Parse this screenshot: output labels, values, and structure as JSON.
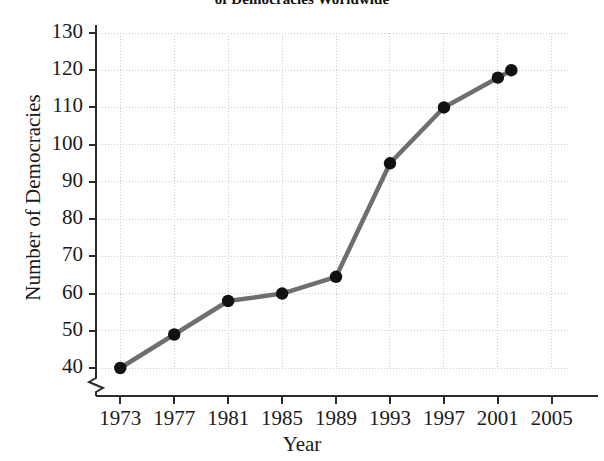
{
  "chart_data": {
    "type": "line",
    "title": "of Democracies Worldwide",
    "xlabel": "Year",
    "ylabel": "Number of Democracies",
    "x": [
      1973,
      1977,
      1981,
      1985,
      1989,
      1993,
      1997,
      2001,
      2002
    ],
    "values": [
      40,
      49,
      58,
      60,
      64.5,
      95,
      110,
      118,
      120
    ],
    "series": [
      {
        "name": "Number of Democracies",
        "points": [
          {
            "x": 1973,
            "y": 40
          },
          {
            "x": 1977,
            "y": 49
          },
          {
            "x": 1981,
            "y": 58
          },
          {
            "x": 1985,
            "y": 60
          },
          {
            "x": 1989,
            "y": 64.5
          },
          {
            "x": 1993,
            "y": 95
          },
          {
            "x": 1997,
            "y": 110
          },
          {
            "x": 2001,
            "y": 118
          },
          {
            "x": 2002,
            "y": 120
          }
        ]
      }
    ],
    "xticks": [
      1973,
      1977,
      1981,
      1985,
      1989,
      1993,
      1997,
      2001,
      2005
    ],
    "xtick_labels": [
      "1973",
      "1977",
      "1981",
      "1985",
      "1989",
      "1993",
      "1997",
      "2001",
      "2005"
    ],
    "yticks": [
      40,
      50,
      60,
      70,
      80,
      90,
      100,
      110,
      120,
      130
    ],
    "ytick_labels": [
      "40",
      "50",
      "60",
      "70",
      "80",
      "90",
      "100",
      "110",
      "120",
      "130"
    ],
    "xlim": [
      1971.2,
      2006.2
    ],
    "ylim": [
      40,
      130
    ],
    "grid": "dotted-both-axes",
    "y_axis_break": true,
    "y_axis_break_symbol": "zigzag",
    "legend": "none",
    "line_color": "#6e6e6e",
    "marker_color": "#111111",
    "grid_color": "#c9c9c9",
    "axis_color": "#2b2b2b",
    "background": "#ffffff"
  }
}
